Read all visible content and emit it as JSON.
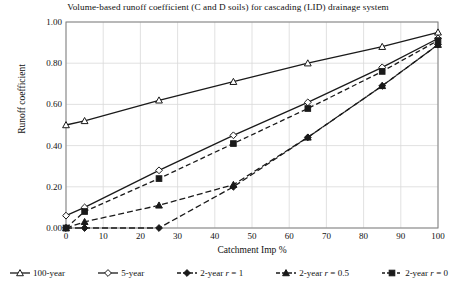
{
  "chart_data": {
    "type": "line",
    "title": "Volume-based runoff coefficient (C and D soils) for cascading (LID) drainage system",
    "xlabel": "Catchment Imp %",
    "ylabel": "Runoff coefficient",
    "xlim": [
      0,
      100
    ],
    "ylim": [
      0,
      1.0
    ],
    "xticks": [
      0,
      10,
      20,
      30,
      40,
      50,
      60,
      70,
      80,
      90,
      100
    ],
    "xtick_labels": [
      "0",
      "10",
      "20",
      "30",
      "40",
      "50",
      "60",
      "70",
      "80",
      "90",
      "100"
    ],
    "yticks": [
      0.0,
      0.2,
      0.4,
      0.6,
      0.8,
      1.0
    ],
    "ytick_labels": [
      "0.00",
      "0.20",
      "0.40",
      "0.60",
      "0.80",
      "1.00"
    ],
    "grid": true,
    "legend_position": "below",
    "series": [
      {
        "name": "100-year",
        "label": "100-year",
        "marker": "open-triangle",
        "line": "solid",
        "color": "#1a1a1a",
        "x": [
          0,
          5,
          25,
          45,
          65,
          85,
          100
        ],
        "values": [
          0.5,
          0.52,
          0.62,
          0.71,
          0.8,
          0.88,
          0.95
        ]
      },
      {
        "name": "5-year",
        "label": "5-year",
        "marker": "open-diamond",
        "line": "solid",
        "color": "#1a1a1a",
        "x": [
          0,
          5,
          25,
          45,
          65,
          85,
          100
        ],
        "values": [
          0.06,
          0.1,
          0.28,
          0.45,
          0.61,
          0.78,
          0.92
        ]
      },
      {
        "name": "2-year r = 1",
        "label": "2-year r = 1",
        "marker": "filled-diamond",
        "line": "dashed",
        "color": "#1a1a1a",
        "x": [
          0,
          5,
          25,
          45,
          65,
          85,
          100
        ],
        "values": [
          0.0,
          0.0,
          0.0,
          0.2,
          0.44,
          0.69,
          0.89
        ]
      },
      {
        "name": "2-year r = 0.5",
        "label": "2-year r = 0.5",
        "marker": "filled-triangle",
        "line": "dashed",
        "color": "#1a1a1a",
        "x": [
          0,
          5,
          25,
          45,
          65,
          85,
          100
        ],
        "values": [
          0.0,
          0.03,
          0.11,
          0.21,
          0.44,
          0.69,
          0.89
        ]
      },
      {
        "name": "2-year r = 0",
        "label": "2-year r = 0",
        "marker": "filled-square",
        "line": "dashed",
        "color": "#1a1a1a",
        "x": [
          0,
          5,
          25,
          45,
          65,
          85,
          100
        ],
        "values": [
          0.0,
          0.08,
          0.24,
          0.41,
          0.58,
          0.76,
          0.91
        ]
      }
    ]
  },
  "legend": {
    "items": [
      {
        "label": "100-year",
        "marker": "open-triangle"
      },
      {
        "label": "5-year",
        "marker": "open-diamond"
      },
      {
        "label": "2-year r = 1",
        "marker": "filled-diamond"
      },
      {
        "label": "2-year r = 0.5",
        "marker": "filled-triangle"
      },
      {
        "label": "2-year r = 0",
        "marker": "filled-square"
      }
    ]
  },
  "style": {
    "axis_color": "#808080",
    "grid_color": "#d9d9d9",
    "line_color": "#1a1a1a",
    "background": "#ffffff"
  }
}
